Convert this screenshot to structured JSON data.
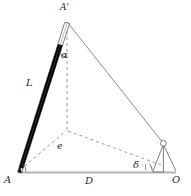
{
  "figure": {
    "background_color": "#ffffff",
    "width": 191,
    "height": 196,
    "colors": {
      "baseline": "#b0b0b0",
      "solid_line": "#8a8a8a",
      "dashed_line": "#9a9a9a",
      "rod_fill": "#000000",
      "rod_outline": "#555555",
      "label_text": "#2b2b2b",
      "instrument": "#6f6f6f"
    }
  },
  "labels": {
    "point_a": "A",
    "point_a_prime": "A'",
    "point_o": "O",
    "baseline_d": "D",
    "rod_length_l": "L",
    "offset_e": "e",
    "angle_alpha": "α",
    "angle_delta": "δ"
  },
  "points": {
    "A": {
      "x": 18,
      "y": 172,
      "label": "A",
      "role": "base-station-left"
    },
    "O": {
      "x": 168,
      "y": 172,
      "label": "O",
      "role": "observer-station-right"
    },
    "A_prime": {
      "x": 67,
      "y": 22,
      "label": "A'",
      "role": "rod-top-apex"
    },
    "e_foot": {
      "x": 67,
      "y": 131,
      "label": "e",
      "role": "vertical-foot-offset"
    },
    "theodolite": {
      "x": 163,
      "y": 143,
      "label": "",
      "role": "instrument-head"
    }
  },
  "segments": [
    {
      "name": "baseline-A-O",
      "from": "A",
      "to": "O",
      "style": "solid",
      "annotation": "D"
    },
    {
      "name": "sight-line-Aprime-O",
      "from": "A_prime",
      "to": "theodolite",
      "style": "solid",
      "annotation": ""
    },
    {
      "name": "rod-A-Aprime",
      "from": "A",
      "to": "A_prime",
      "style": "rod",
      "annotation": "L"
    },
    {
      "name": "vertical-Aprime-e",
      "from": "A_prime",
      "to": "e_foot",
      "style": "dashed",
      "annotation": ""
    },
    {
      "name": "offset-A-e",
      "from": "A",
      "to": "e_foot",
      "style": "dashed",
      "annotation": "e"
    },
    {
      "name": "offset-e-O",
      "from": "e_foot",
      "to": "theodolite",
      "style": "dashed",
      "annotation": ""
    }
  ],
  "angles": [
    {
      "name": "alpha",
      "symbol": "α",
      "at": "A_prime",
      "between": [
        "rod-A-Aprime",
        "vertical-Aprime-e"
      ]
    },
    {
      "name": "delta",
      "symbol": "δ",
      "at": "theodolite",
      "between": [
        "offset-e-O",
        "baseline-A-O"
      ]
    },
    {
      "name": "tilt",
      "symbol": "",
      "at": "A",
      "between": [
        "rod-A-Aprime",
        "baseline-A-O"
      ]
    }
  ],
  "instrument": {
    "name": "theodolite-tripod",
    "head_radius": 3,
    "legs": 3
  }
}
